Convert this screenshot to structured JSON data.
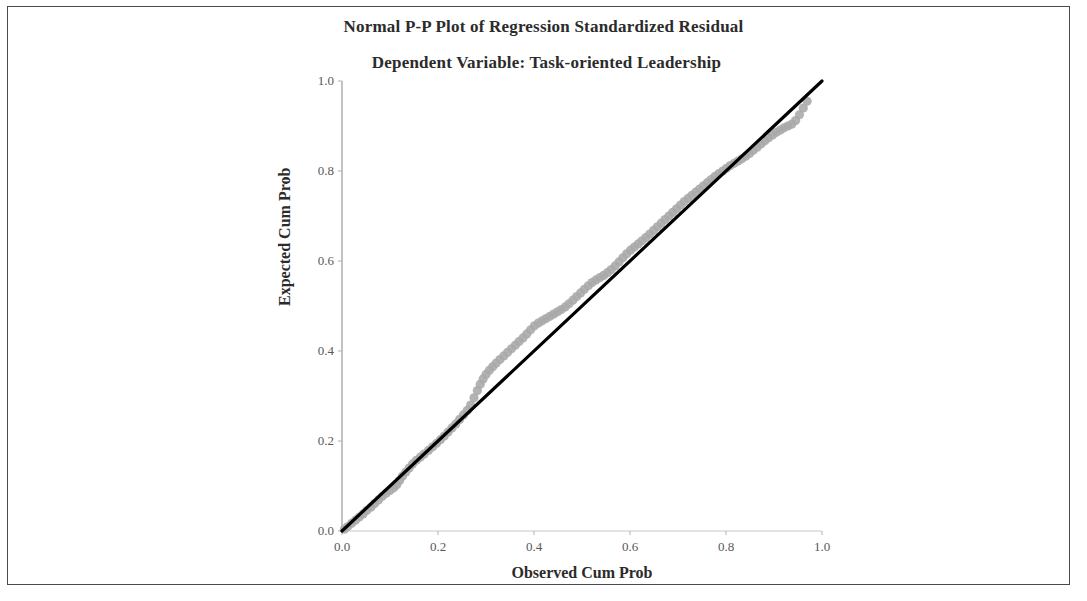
{
  "chart_data": {
    "type": "scatter",
    "title": "Normal P-P Plot of Regression Standardized Residual",
    "subtitle": "Dependent Variable: Task-oriented Leadership",
    "xlabel": "Observed Cum Prob",
    "ylabel": "Expected Cum Prob",
    "xlim": [
      0.0,
      1.0
    ],
    "ylim": [
      0.0,
      1.0
    ],
    "grid": false,
    "legend": "none",
    "xticks": [
      "0.0",
      "0.2",
      "0.4",
      "0.6",
      "0.8",
      "1.0"
    ],
    "xtick_values": [
      0.0,
      0.2,
      0.4,
      0.6,
      0.8,
      1.0
    ],
    "yticks": [
      "0.0",
      "0.2",
      "0.4",
      "0.6",
      "0.8",
      "1.0"
    ],
    "ytick_values": [
      0.0,
      0.2,
      0.4,
      0.6,
      0.8,
      1.0
    ],
    "point_color": "#a9a9a9",
    "line_color": "#000000",
    "reference_line": {
      "x": [
        0.0,
        1.0
      ],
      "y": [
        0.0,
        1.0
      ]
    },
    "series": [
      {
        "name": "Standardized Residual",
        "x": [
          0.005,
          0.012,
          0.02,
          0.028,
          0.036,
          0.044,
          0.052,
          0.06,
          0.068,
          0.076,
          0.084,
          0.092,
          0.1,
          0.108,
          0.114,
          0.12,
          0.126,
          0.133,
          0.14,
          0.147,
          0.155,
          0.163,
          0.171,
          0.18,
          0.189,
          0.197,
          0.205,
          0.213,
          0.221,
          0.229,
          0.237,
          0.245,
          0.253,
          0.261,
          0.268,
          0.275,
          0.282,
          0.288,
          0.294,
          0.3,
          0.307,
          0.314,
          0.321,
          0.329,
          0.337,
          0.345,
          0.353,
          0.361,
          0.369,
          0.377,
          0.385,
          0.393,
          0.401,
          0.409,
          0.417,
          0.425,
          0.433,
          0.441,
          0.449,
          0.457,
          0.465,
          0.473,
          0.481,
          0.489,
          0.497,
          0.505,
          0.513,
          0.521,
          0.529,
          0.537,
          0.545,
          0.553,
          0.561,
          0.569,
          0.577,
          0.585,
          0.593,
          0.601,
          0.609,
          0.617,
          0.625,
          0.633,
          0.641,
          0.649,
          0.657,
          0.665,
          0.673,
          0.681,
          0.689,
          0.697,
          0.705,
          0.713,
          0.721,
          0.729,
          0.737,
          0.745,
          0.753,
          0.761,
          0.769,
          0.777,
          0.785,
          0.793,
          0.801,
          0.809,
          0.817,
          0.825,
          0.833,
          0.841,
          0.849,
          0.857,
          0.865,
          0.873,
          0.881,
          0.889,
          0.897,
          0.905,
          0.913,
          0.921,
          0.929,
          0.937,
          0.945,
          0.953,
          0.961,
          0.969
        ],
        "y": [
          0.004,
          0.01,
          0.017,
          0.024,
          0.031,
          0.038,
          0.046,
          0.053,
          0.061,
          0.069,
          0.077,
          0.084,
          0.09,
          0.096,
          0.103,
          0.112,
          0.122,
          0.131,
          0.14,
          0.149,
          0.157,
          0.164,
          0.171,
          0.179,
          0.187,
          0.195,
          0.203,
          0.211,
          0.22,
          0.229,
          0.238,
          0.248,
          0.258,
          0.268,
          0.28,
          0.296,
          0.312,
          0.326,
          0.338,
          0.348,
          0.357,
          0.365,
          0.373,
          0.381,
          0.389,
          0.397,
          0.405,
          0.413,
          0.421,
          0.429,
          0.438,
          0.447,
          0.456,
          0.462,
          0.467,
          0.472,
          0.477,
          0.482,
          0.487,
          0.492,
          0.498,
          0.505,
          0.513,
          0.521,
          0.529,
          0.537,
          0.545,
          0.552,
          0.558,
          0.563,
          0.568,
          0.574,
          0.581,
          0.589,
          0.598,
          0.607,
          0.616,
          0.624,
          0.631,
          0.638,
          0.645,
          0.652,
          0.66,
          0.668,
          0.676,
          0.684,
          0.692,
          0.7,
          0.708,
          0.716,
          0.724,
          0.732,
          0.739,
          0.746,
          0.753,
          0.76,
          0.767,
          0.774,
          0.781,
          0.788,
          0.794,
          0.8,
          0.806,
          0.812,
          0.817,
          0.822,
          0.827,
          0.833,
          0.839,
          0.846,
          0.853,
          0.86,
          0.867,
          0.874,
          0.88,
          0.886,
          0.891,
          0.896,
          0.9,
          0.904,
          0.912,
          0.925,
          0.94,
          0.955
        ]
      }
    ]
  }
}
